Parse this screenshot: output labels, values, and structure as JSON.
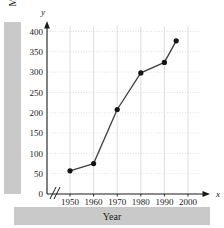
{
  "chart_data": {
    "type": "line",
    "title": "",
    "xlabel": "Year",
    "ylabel": "Master's degrees (thousands)",
    "x": [
      1950,
      1960,
      1970,
      1980,
      1990,
      1995
    ],
    "values": [
      57,
      75,
      208,
      298,
      324,
      377
    ],
    "xlim": [
      1945,
      2002
    ],
    "ylim": [
      0,
      415
    ],
    "xticks": [
      1950,
      1960,
      1970,
      1980,
      1990,
      2000
    ],
    "yticks": [
      0,
      50,
      100,
      150,
      200,
      250,
      300,
      350,
      400
    ],
    "xtick_labels": [
      "1950",
      "1960",
      "1970",
      "1980",
      "1990",
      "2000"
    ],
    "ytick_labels": [
      "0",
      "50",
      "100",
      "150",
      "200",
      "250",
      "300",
      "350",
      "400"
    ],
    "grid": true,
    "legend": null,
    "axis_break": "//",
    "x_axis_symbol": "x",
    "y_axis_symbol": "y",
    "marker": "filled-circle",
    "line_color": "#3c3c3c",
    "marker_color": "#141414",
    "grid_color": "#d5d5d5",
    "band_color": "#c9c9c9"
  }
}
